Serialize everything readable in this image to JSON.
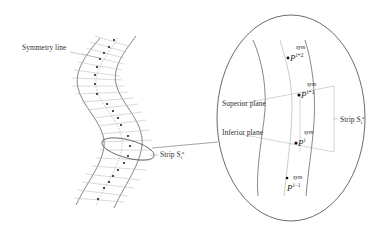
{
  "figure": {
    "left_panel": {
      "symmetry_line_label": "Symmetry line",
      "strip_label": "Strip S",
      "strip_label_sub": "i",
      "strip_label_sup": "a"
    },
    "zoom_panel": {
      "superior_plane_label": "Superior plane",
      "inferior_plane_label": "Inferior plane",
      "strip_label": "Strip S",
      "strip_label_sub": "i",
      "strip_label_sup": "a",
      "points": [
        {
          "base": "P",
          "sup": "sym",
          "sub": "i+2"
        },
        {
          "base": "P",
          "sup": "sym",
          "sub": "i+1"
        },
        {
          "base": "P",
          "sup": "sym",
          "sub": "i"
        },
        {
          "base": "P",
          "sup": "sym",
          "sub": "i−1"
        }
      ]
    },
    "colors": {
      "line": "#555555",
      "thin_line": "#aaaaaa",
      "dot": "#222222",
      "text": "#333333"
    }
  }
}
